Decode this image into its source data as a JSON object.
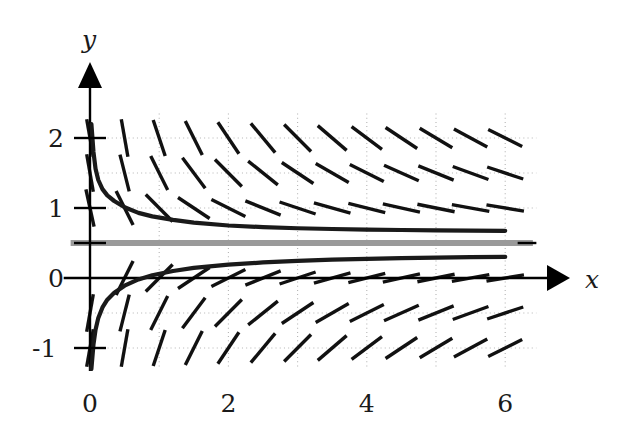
{
  "figure": {
    "kind": "slope-field-plot",
    "background_color": "#ffffff",
    "axis_color": "#000000",
    "curve_color": "#1a1a1a",
    "asymptote_color": "#9a9a9a",
    "grid_color": "#b4b4b4",
    "slope_mark_color": "#111111"
  },
  "axes": {
    "x_axis_label": "x",
    "y_axis_label": "y",
    "x_ticks": [
      "0",
      "2",
      "4",
      "6"
    ],
    "x_tick_values": [
      0,
      2,
      4,
      6
    ],
    "y_ticks": [
      "2",
      "1",
      "0",
      "-1"
    ],
    "y_tick_values": [
      2,
      1,
      0,
      -1
    ],
    "x_range": [
      -0.3,
      6.9
    ],
    "y_range": [
      -1.35,
      2.6
    ],
    "x_gridlines": [
      1,
      2,
      3,
      4,
      5,
      6
    ],
    "y_gridlines": [
      -1,
      -0.5,
      0.5,
      1,
      1.5,
      2
    ],
    "grid": "dotted",
    "x_arrow": true,
    "y_arrow": true
  },
  "chart_data": {
    "type": "line",
    "title": "",
    "xlabel": "x",
    "ylabel": "y",
    "xlim": [
      -0.3,
      6.9
    ],
    "ylim": [
      -1.35,
      2.6
    ],
    "grid": true,
    "legend": "none",
    "series": [
      {
        "name": "upper-solution-curve",
        "color": "#1a1a1a",
        "points": [
          [
            0.02,
            2.2
          ],
          [
            0.05,
            1.8
          ],
          [
            0.08,
            1.56
          ],
          [
            0.12,
            1.4
          ],
          [
            0.18,
            1.27
          ],
          [
            0.25,
            1.18
          ],
          [
            0.35,
            1.1
          ],
          [
            0.5,
            1.01
          ],
          [
            0.7,
            0.93
          ],
          [
            0.9,
            0.88
          ],
          [
            1.2,
            0.83
          ],
          [
            1.5,
            0.79
          ],
          [
            2.0,
            0.75
          ],
          [
            2.5,
            0.727
          ],
          [
            3.0,
            0.711
          ],
          [
            3.5,
            0.7
          ],
          [
            4.0,
            0.692
          ],
          [
            4.5,
            0.686
          ],
          [
            5.0,
            0.681
          ],
          [
            5.5,
            0.677
          ],
          [
            6.0,
            0.674
          ]
        ]
      },
      {
        "name": "lower-solution-curve",
        "color": "#1a1a1a",
        "points": [
          [
            0.02,
            -1.3
          ],
          [
            0.05,
            -0.95
          ],
          [
            0.08,
            -0.74
          ],
          [
            0.12,
            -0.57
          ],
          [
            0.18,
            -0.42
          ],
          [
            0.25,
            -0.31
          ],
          [
            0.35,
            -0.21
          ],
          [
            0.5,
            -0.11
          ],
          [
            0.7,
            -0.02
          ],
          [
            0.9,
            0.04
          ],
          [
            1.2,
            0.1
          ],
          [
            1.5,
            0.145
          ],
          [
            2.0,
            0.19
          ],
          [
            2.5,
            0.222
          ],
          [
            3.0,
            0.245
          ],
          [
            3.5,
            0.262
          ],
          [
            4.0,
            0.274
          ],
          [
            4.5,
            0.284
          ],
          [
            5.0,
            0.291
          ],
          [
            5.5,
            0.297
          ],
          [
            6.0,
            0.302
          ]
        ]
      },
      {
        "name": "asymptote-line",
        "color": "#9a9a9a",
        "points": [
          [
            -0.28,
            0.5
          ],
          [
            6.4,
            0.5
          ]
        ]
      }
    ],
    "slope_field": {
      "description": "short line segments showing direction field slopes",
      "x_positions": [
        0.0,
        0.5,
        1.0,
        1.5,
        2.0,
        2.5,
        3.0,
        3.5,
        4.0,
        4.5,
        5.0,
        5.5,
        6.0
      ],
      "y_positions": [
        -1.0,
        -0.5,
        0.0,
        0.5,
        1.0,
        1.5,
        2.0
      ],
      "mark_length": 38
    }
  }
}
